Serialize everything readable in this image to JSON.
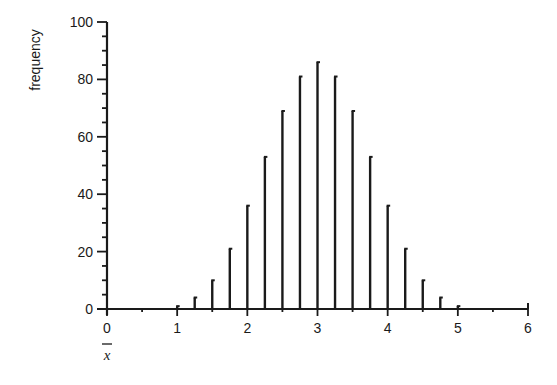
{
  "chart_data": {
    "type": "bar",
    "title": "",
    "xlabel": "x̄",
    "ylabel": "frequency",
    "xlim": [
      0,
      6
    ],
    "ylim": [
      0,
      100
    ],
    "x_ticks": [
      0,
      1,
      2,
      3,
      4,
      5,
      6
    ],
    "y_ticks": [
      0,
      20,
      40,
      60,
      80,
      100
    ],
    "grid": false,
    "legend": null,
    "style": "spike/needle bars",
    "x": [
      1.0,
      1.25,
      1.5,
      1.75,
      2.0,
      2.25,
      2.5,
      2.75,
      3.0,
      3.25,
      3.5,
      3.75,
      4.0,
      4.25,
      4.5,
      4.75,
      5.0
    ],
    "values": [
      1,
      4,
      10,
      21,
      36,
      53,
      69,
      81,
      86,
      81,
      69,
      53,
      36,
      21,
      10,
      4,
      1
    ]
  },
  "colors": {
    "ink": "#1a1a1a",
    "background": "#ffffff"
  }
}
